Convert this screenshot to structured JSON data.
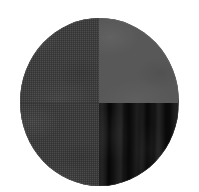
{
  "canvas": {
    "width": 199,
    "height": 192,
    "background_color": "#ffffff"
  },
  "swatch": {
    "shape": "circle",
    "label": "quadrant-circle-swatch",
    "center_x": 99,
    "center_y": 102,
    "diameter_x": 159,
    "diameter_y": 168,
    "quadrants": [
      {
        "id": "top-left",
        "color": "#3c3c3c",
        "texture": "fine-dither-noise",
        "description": "dark gray with fine checkered grain"
      },
      {
        "id": "top-right",
        "color": "#585858",
        "texture": "smooth-mottled",
        "description": "medium gray, smoother and lighter"
      },
      {
        "id": "bottom-left",
        "color": "#3a3a3a",
        "texture": "fine-dither-noise",
        "description": "dark gray with fine checkered grain"
      },
      {
        "id": "bottom-right",
        "color": "#121212",
        "texture": "vertical-wavy-stripes",
        "description": "near-black with vertical wavy banding"
      }
    ]
  }
}
